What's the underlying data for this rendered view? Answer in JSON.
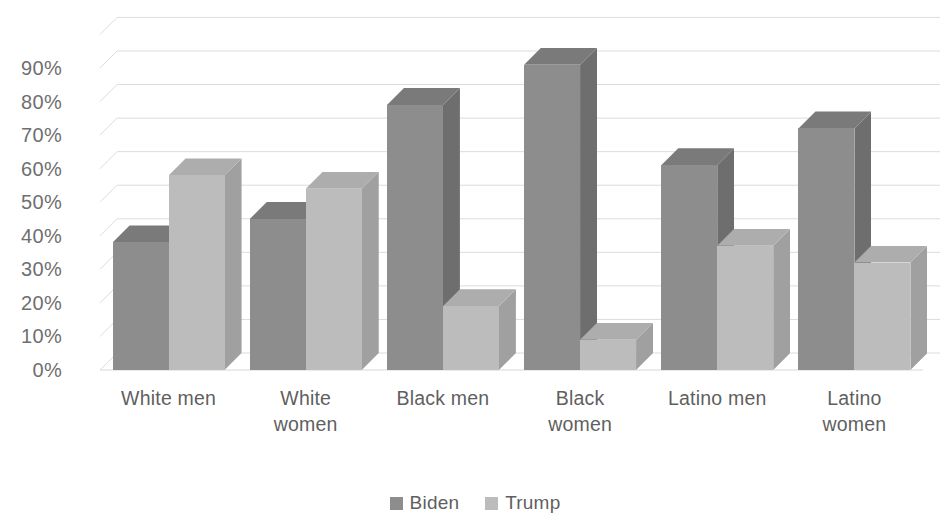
{
  "chart_data": {
    "type": "bar",
    "title": "",
    "subtitle": "",
    "xlabel": "",
    "ylabel": "",
    "categories": [
      "White men",
      "White women",
      "Black men",
      "Black women",
      "Latino men",
      "Latino women"
    ],
    "series": [
      {
        "name": "Biden",
        "color": "#8d8d8d",
        "values": [
          38,
          45,
          79,
          91,
          61,
          72
        ]
      },
      {
        "name": "Trump",
        "color": "#bcbcbc",
        "values": [
          58,
          54,
          19,
          9,
          37,
          32
        ]
      }
    ],
    "ylim": [
      0,
      90
    ],
    "ytick_values": [
      0,
      10,
      20,
      30,
      40,
      50,
      60,
      70,
      80,
      90
    ],
    "ytick_labels": [
      "0%",
      "10%",
      "20%",
      "30%",
      "40%",
      "50%",
      "60%",
      "70%",
      "80%",
      "90%"
    ],
    "grid": true,
    "grid_color": "#dcdcdc",
    "legend_position": "bottom",
    "three_d": true,
    "value_suffix": "%",
    "background": "#ffffff",
    "text_color": "#5f5f5f"
  },
  "axis": {
    "y_ticks": [
      {
        "label": "90%",
        "value": 90
      },
      {
        "label": "80%",
        "value": 80
      },
      {
        "label": "70%",
        "value": 70
      },
      {
        "label": "60%",
        "value": 60
      },
      {
        "label": "50%",
        "value": 50
      },
      {
        "label": "40%",
        "value": 40
      },
      {
        "label": "30%",
        "value": 30
      },
      {
        "label": "20%",
        "value": 20
      },
      {
        "label": "10%",
        "value": 10
      },
      {
        "label": "0%",
        "value": 0
      }
    ],
    "x_categories": [
      {
        "label": "White men",
        "lines": [
          "White men"
        ]
      },
      {
        "label": "White women",
        "lines": [
          "White",
          "women"
        ]
      },
      {
        "label": "Black men",
        "lines": [
          "Black men"
        ]
      },
      {
        "label": "Black women",
        "lines": [
          "Black",
          "women"
        ]
      },
      {
        "label": "Latino men",
        "lines": [
          "Latino men"
        ]
      },
      {
        "label": "Latino women",
        "lines": [
          "Latino",
          "women"
        ]
      }
    ]
  },
  "legend": {
    "items": [
      {
        "label": "Biden",
        "color": "#8d8d8d"
      },
      {
        "label": "Trump",
        "color": "#bcbcbc"
      }
    ]
  }
}
